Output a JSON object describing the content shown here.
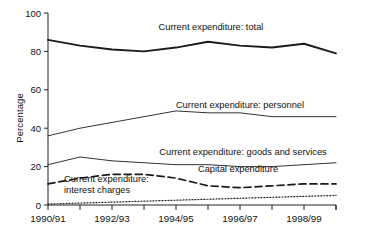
{
  "chart_data": {
    "type": "line",
    "title": "",
    "xlabel": "",
    "ylabel": "Percentage",
    "ylim": [
      0,
      100
    ],
    "yticks": [
      0,
      20,
      40,
      60,
      80,
      100
    ],
    "ytick_labels": [
      "0",
      "20",
      "40",
      "60",
      "80",
      "100"
    ],
    "grid": false,
    "legend_position": "inline-annotations",
    "x": [
      "1990/91",
      "1991/92",
      "1992/93",
      "1993/94",
      "1994/95",
      "1995/96",
      "1996/97",
      "1997/98",
      "1998/99",
      "1999/2000"
    ],
    "xtick_labels": [
      "1990/91",
      "",
      "1992/93",
      "",
      "1994/95",
      "",
      "1996/97",
      "",
      "1998/99",
      ""
    ],
    "series": [
      {
        "name": "Current expenditure: total",
        "style": "solid-thick",
        "values": [
          86,
          83,
          81,
          80,
          82,
          85,
          83,
          82,
          84,
          79
        ]
      },
      {
        "name": "Current expenditure: personnel",
        "style": "solid-thin",
        "values": [
          36,
          40,
          43,
          46,
          49,
          48,
          48,
          46,
          46,
          46
        ]
      },
      {
        "name": "Current expenditure: goods and services",
        "style": "solid-thin",
        "values": [
          21,
          25,
          23,
          22,
          21,
          21,
          20,
          20,
          21,
          22
        ]
      },
      {
        "name": "Capital expenditure",
        "style": "dashed",
        "values": [
          11,
          14,
          16,
          16,
          14,
          10,
          9,
          10,
          11,
          11
        ]
      },
      {
        "name": "Current expenditure: interest charges",
        "style": "dotted",
        "values": [
          0.5,
          1,
          1.5,
          2,
          2.5,
          3,
          3.5,
          4,
          4.5,
          5
        ]
      }
    ],
    "annotations": [
      {
        "text": "Current expenditure: total",
        "x": 211,
        "y": 30,
        "anchor": "middle"
      },
      {
        "text": "Current expenditure: personnel",
        "x": 240,
        "y": 108,
        "anchor": "middle"
      },
      {
        "text": "Current expenditure: goods and services",
        "x": 243,
        "y": 155,
        "anchor": "middle"
      },
      {
        "text": "Capital expenditure",
        "x": 238,
        "y": 172,
        "anchor": "middle"
      },
      {
        "text": "Current expenditure:",
        "x": 64,
        "y": 182,
        "anchor": "start"
      },
      {
        "text": "interest charges",
        "x": 64,
        "y": 193,
        "anchor": "start"
      }
    ]
  }
}
